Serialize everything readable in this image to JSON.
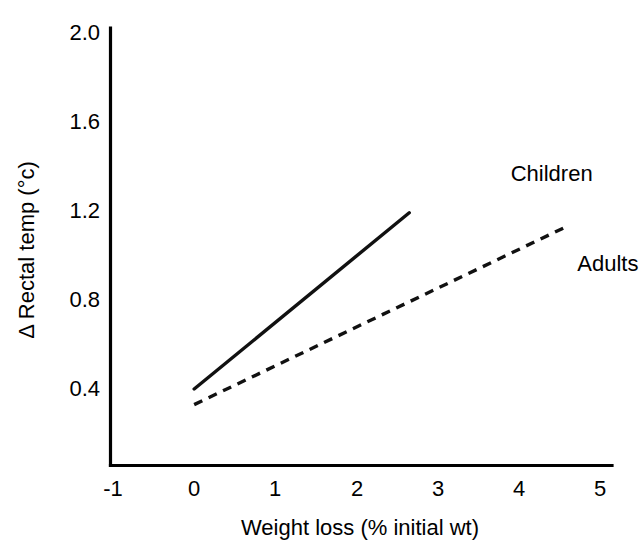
{
  "chart_data": {
    "type": "line",
    "title": "",
    "xlabel": "Weight loss  (% initial wt)",
    "ylabel": "Δ Rectal temp (°c)",
    "xlim": [
      -1,
      5
    ],
    "ylim": [
      0.2,
      2.0
    ],
    "xticks": [
      "-1",
      "0",
      "1",
      "2",
      "3",
      "4",
      "5"
    ],
    "xtick_values": [
      -1,
      0,
      1,
      2,
      3,
      4,
      5
    ],
    "yticks": [
      "0.4",
      "0.8",
      "1.2",
      "1.6",
      "2.0"
    ],
    "ytick_values": [
      0.4,
      0.8,
      1.2,
      1.6,
      2.0
    ],
    "grid": false,
    "legend_position": "inline-annotations",
    "line_color": "#111111",
    "axis_color": "#000000",
    "background": "#ffffff",
    "series": [
      {
        "name": "Children",
        "style": "solid",
        "x": [
          0.0,
          2.65
        ],
        "y": [
          0.4,
          1.19
        ],
        "label": "Children",
        "label_x": 3.9,
        "label_y": 1.33
      },
      {
        "name": "Adults",
        "style": "dashed",
        "x": [
          0.0,
          4.6
        ],
        "y": [
          0.33,
          1.13
        ],
        "label": "Adults",
        "label_x": 4.72,
        "label_y": 0.93
      }
    ]
  },
  "axes": {
    "y_title": "Δ Rectal temp (°c)",
    "x_title": "Weight loss  (% initial wt)",
    "y_tick_labels": {
      "t5": "2.0",
      "t4": "1.6",
      "t3": "1.2",
      "t2": "0.8",
      "t1": "0.4"
    },
    "x_tick_labels": {
      "t1": "-1",
      "t2": "0",
      "t3": "1",
      "t4": "2",
      "t5": "3",
      "t6": "4",
      "t7": "5"
    }
  },
  "annotations": {
    "children_label": "Children",
    "adults_label": "Adults"
  }
}
